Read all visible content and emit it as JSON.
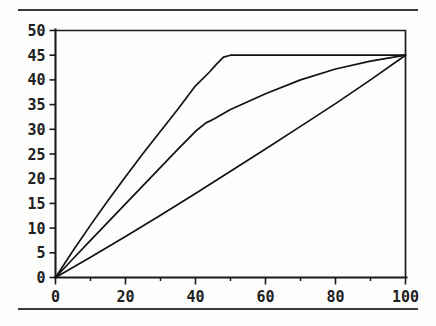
{
  "figure": {
    "background_color": "#fdfdfc",
    "line_color": "#121212",
    "has_top_rule": true,
    "has_bottom_rule": true
  },
  "chart_data": {
    "type": "line",
    "title": "",
    "subtitle": "",
    "xlabel": "",
    "ylabel": "",
    "xlim": [
      0,
      100
    ],
    "ylim": [
      0,
      50
    ],
    "grid": false,
    "legend": "none",
    "x_ticks": [
      0,
      20,
      40,
      60,
      80,
      100
    ],
    "x_tick_labels": [
      "0",
      "20",
      "40",
      "60",
      "80",
      "100"
    ],
    "x_minor_ticks": [
      10,
      30,
      50,
      70,
      90
    ],
    "y_ticks": [
      0,
      5,
      10,
      15,
      20,
      25,
      30,
      35,
      40,
      45,
      50
    ],
    "y_tick_labels": [
      "0",
      "5",
      "10",
      "15",
      "20",
      "25",
      "30",
      "35",
      "40",
      "45",
      "50"
    ],
    "series": [
      {
        "name": "upper-curve",
        "x": [
          0,
          5,
          10,
          15,
          20,
          25,
          30,
          35,
          40,
          44,
          46,
          48,
          50,
          60,
          70,
          80,
          90,
          100
        ],
        "y": [
          0,
          5.4,
          10.6,
          15.6,
          20.4,
          25.1,
          29.6,
          34.1,
          38.8,
          41.6,
          43.2,
          44.6,
          45.0,
          45.0,
          45.0,
          45.0,
          45.0,
          45.0
        ]
      },
      {
        "name": "middle-curve",
        "x": [
          0,
          5,
          10,
          15,
          20,
          25,
          30,
          35,
          40,
          43,
          45,
          48,
          50,
          60,
          70,
          80,
          90,
          100
        ],
        "y": [
          0,
          3.8,
          7.5,
          11.2,
          14.9,
          18.6,
          22.3,
          26.0,
          29.6,
          31.3,
          32.0,
          33.2,
          34.0,
          37.2,
          40.0,
          42.2,
          43.8,
          45.0
        ]
      },
      {
        "name": "lower-curve",
        "x": [
          0,
          10,
          20,
          30,
          40,
          50,
          60,
          70,
          80,
          90,
          100
        ],
        "y": [
          0,
          4.1,
          8.3,
          12.6,
          17.0,
          21.5,
          26.0,
          30.6,
          35.2,
          40.0,
          45.0
        ]
      }
    ]
  }
}
